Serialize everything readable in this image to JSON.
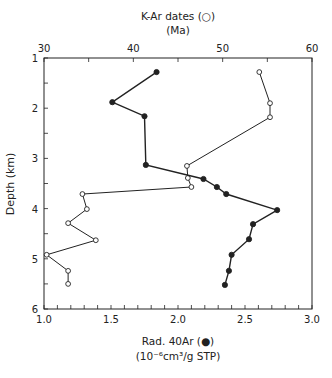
{
  "chart_data": {
    "type": "line",
    "top_axis": {
      "label_line1": "K-Ar dates (○)",
      "label_line2": "(Ma)",
      "range": [
        30,
        60
      ],
      "ticks": [
        30,
        40,
        50,
        60
      ],
      "minor_step": 5
    },
    "bottom_axis": {
      "label_line1": "Rad. 40Ar (●)",
      "label_line2": "(10⁻⁶cm³/g STP)",
      "range": [
        1.0,
        3.0
      ],
      "ticks": [
        "1.0",
        "1.5",
        "2.0",
        "2.5",
        "3.0"
      ],
      "minor_step": 0.1
    },
    "y_axis": {
      "label": "Depth (km)",
      "range": [
        1,
        6
      ],
      "inverted": true,
      "ticks": [
        1,
        2,
        3,
        4,
        5,
        6
      ],
      "minor_step": 0.5
    },
    "series": [
      {
        "name": "K-Ar dates",
        "marker": "open-circle",
        "axis": "top",
        "points": [
          {
            "x": 54.1,
            "depth": 1.28
          },
          {
            "x": 55.3,
            "depth": 1.9
          },
          {
            "x": 55.3,
            "depth": 2.18
          },
          {
            "x": 46.0,
            "depth": 3.15
          },
          {
            "x": 46.1,
            "depth": 3.39
          },
          {
            "x": 46.5,
            "depth": 3.57
          },
          {
            "x": 34.3,
            "depth": 3.71
          },
          {
            "x": 34.8,
            "depth": 4.01
          },
          {
            "x": 32.7,
            "depth": 4.29
          },
          {
            "x": 35.8,
            "depth": 4.63
          },
          {
            "x": 30.3,
            "depth": 4.92
          },
          {
            "x": 32.7,
            "depth": 5.24
          },
          {
            "x": 32.7,
            "depth": 5.5
          }
        ]
      },
      {
        "name": "Rad. 40Ar",
        "marker": "filled-circle",
        "axis": "bottom",
        "points": [
          {
            "x": 1.84,
            "depth": 1.28
          },
          {
            "x": 1.51,
            "depth": 1.88
          },
          {
            "x": 1.75,
            "depth": 2.16
          },
          {
            "x": 1.76,
            "depth": 3.13
          },
          {
            "x": 2.19,
            "depth": 3.41
          },
          {
            "x": 2.29,
            "depth": 3.57
          },
          {
            "x": 2.36,
            "depth": 3.71
          },
          {
            "x": 2.74,
            "depth": 4.03
          },
          {
            "x": 2.56,
            "depth": 4.31
          },
          {
            "x": 2.53,
            "depth": 4.61
          },
          {
            "x": 2.4,
            "depth": 4.92
          },
          {
            "x": 2.38,
            "depth": 5.24
          },
          {
            "x": 2.35,
            "depth": 5.52
          }
        ]
      }
    ],
    "grid": false,
    "legend": "none (markers described in axis labels)"
  },
  "colors": {
    "ink": "#222222",
    "background": "#ffffff"
  }
}
